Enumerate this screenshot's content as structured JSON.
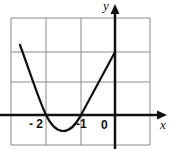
{
  "figure": {
    "type": "function-graph",
    "function": "parabola",
    "axis_labels": {
      "x": "x",
      "y": "y"
    },
    "tick_labels": [
      {
        "text": "- 2",
        "value": -2
      },
      {
        "text": "-1",
        "value": -1
      },
      {
        "text": "0",
        "value": 0
      }
    ],
    "roots": [
      -2,
      -1
    ],
    "y_intercept": 2,
    "vertex": {
      "x": -1.5,
      "y": -0.25
    },
    "grid": {
      "x_range": [
        -3,
        1
      ],
      "y_range": [
        -1,
        3
      ],
      "step": 1
    },
    "colors": {
      "curve": "#111111",
      "axes": "#111111",
      "grid": "#8a8a8a"
    }
  }
}
